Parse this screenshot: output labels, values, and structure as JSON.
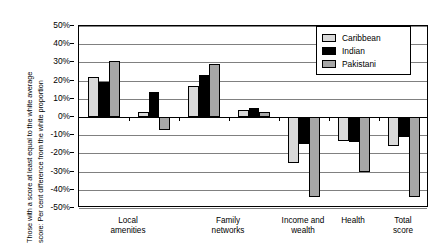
{
  "chart_data": {
    "type": "bar",
    "title": "",
    "subtitle": "",
    "xlabel": "",
    "ylabel": "Those with a score at least equal to the white average score: Per cent difference from the white proportion",
    "ylim": [
      -50,
      50
    ],
    "ytick_labels": [
      "50%",
      "40%",
      "30%",
      "20%",
      "10%",
      "0%",
      "-10%",
      "-20%",
      "-30%",
      "-40%",
      "-50%"
    ],
    "ytick_values": [
      50,
      40,
      30,
      20,
      10,
      0,
      -10,
      -20,
      -30,
      -40,
      -50
    ],
    "grid": true,
    "legend_position": "top-right",
    "categories": [
      "Local\namenities",
      "Family\nnetworks",
      "Income and\nwealth",
      "Health",
      "Total score"
    ],
    "series": [
      {
        "name": "Caribbean",
        "color": "#d9d9d9",
        "values": [
          22,
          17,
          -25,
          -13,
          -16
        ]
      },
      {
        "name": "Indian",
        "color": "#000000",
        "values": [
          19,
          23,
          -15,
          -14,
          -11
        ]
      },
      {
        "name": "Pakistani",
        "color": "#a6a6a6",
        "values": [
          31,
          29,
          -44,
          -30,
          -44
        ]
      }
    ],
    "secondary_groups": [
      {
        "after_category": "Local amenities",
        "values": {
          "Caribbean": 3,
          "Indian": 14,
          "Pakistani": -7
        }
      },
      {
        "after_category": "Family networks",
        "values": {
          "Caribbean": 4,
          "Indian": 5,
          "Pakistani": 3
        }
      }
    ]
  },
  "legend": {
    "items": [
      {
        "label": "Caribbean",
        "color": "#d9d9d9"
      },
      {
        "label": "Indian",
        "color": "#000000"
      },
      {
        "label": "Pakistani",
        "color": "#a6a6a6"
      }
    ]
  },
  "axis": {
    "y_title": "Those with a score at least equal to the white average\nscore: Per cent difference from the white proportion"
  }
}
